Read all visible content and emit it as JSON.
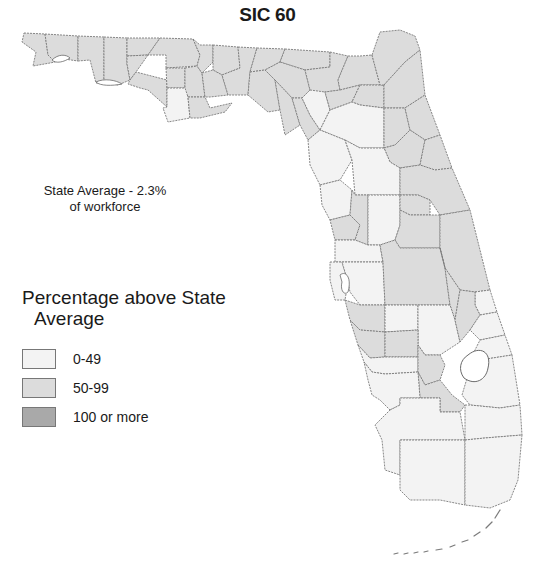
{
  "title": "SIC 60",
  "state_average": {
    "line1": "State Average - 2.3%",
    "line2": "of workforce"
  },
  "legend": {
    "title_line1": "Percentage above State",
    "title_line2": "Average",
    "items": [
      {
        "label": "0-49",
        "color": "#f3f3f3"
      },
      {
        "label": "50-99",
        "color": "#dcdcdc"
      },
      {
        "label": "100 or more",
        "color": "#a9a9a9"
      }
    ]
  },
  "colors": {
    "low": "#f3f3f3",
    "mid": "#dcdcdc",
    "high": "#a9a9a9",
    "border": "#7a7a7a"
  },
  "map": {
    "region": "Florida",
    "level": "county"
  }
}
